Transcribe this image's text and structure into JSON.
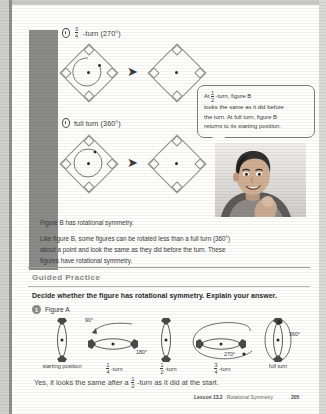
{
  "page": {
    "background_color": "#fefefc",
    "sidebar_color": "#8a8a88"
  },
  "sections": [
    {
      "id": "three-quarter-turn",
      "bullet_icon": "oval-bullet-icon",
      "label_prefix": "",
      "fraction": {
        "numerator": "3",
        "denominator": "4"
      },
      "label_suffix": "-turn (270°)"
    },
    {
      "id": "full-turn",
      "bullet_icon": "oval-bullet-icon",
      "label_prefix": "",
      "fraction": null,
      "label_suffix": "full turn (360°)"
    }
  ],
  "callout": {
    "line1_prefix": "At ",
    "fraction": {
      "numerator": "1",
      "denominator": "2"
    },
    "line1_suffix": "-turn, figure B",
    "line2": "looks the same as it did before",
    "line3": "the turn. At full turn, figure B",
    "line4": "returns to its starting position."
  },
  "photo": {
    "alt": "student-photo",
    "description": "smiling boy resting chin on hand"
  },
  "paragraphs": [
    "Figure B has rotational symmetry.",
    "Like figure B, some figures can be rotated less than a full turn (360°) about a point and look the same as they did before the turn. These figures have rotational symmetry."
  ],
  "guided_practice": {
    "heading": "Guided Practice",
    "instruction": "Decide whether the figure has rotational symmetry. Explain your answer.",
    "question_number": "1",
    "question_label": "Figure A",
    "figures": [
      {
        "caption": "starting position",
        "fraction": null,
        "angle_label": "",
        "orientation": "vertical"
      },
      {
        "caption": "-turn",
        "fraction": {
          "numerator": "1",
          "denominator": "4"
        },
        "angle_label": "90°",
        "orientation": "horizontal"
      },
      {
        "caption": "-turn",
        "fraction": {
          "numerator": "1",
          "denominator": "2"
        },
        "angle_label": "180°",
        "orientation": "vertical"
      },
      {
        "caption": "-turn",
        "fraction": {
          "numerator": "3",
          "denominator": "4"
        },
        "angle_label": "270°",
        "orientation": "horizontal"
      },
      {
        "caption": "full turn",
        "fraction": null,
        "angle_label": "360°",
        "orientation": "vertical"
      }
    ],
    "answer_prefix": "Yes, it looks the same after a ",
    "answer_fraction": {
      "numerator": "1",
      "denominator": "2"
    },
    "answer_suffix": "-turn as it did at the start."
  },
  "footer": {
    "lesson": "Lesson 13.2",
    "topic": "Rotational Symmetry",
    "page_number": "205"
  }
}
